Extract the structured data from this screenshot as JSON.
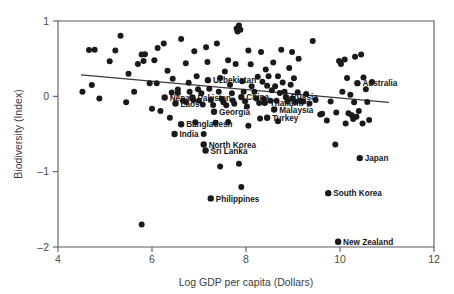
{
  "chart_data": {
    "type": "scatter",
    "title": "",
    "xlabel": "Log GDP per capita (Dollars)",
    "ylabel": "Biodiversity (Index)",
    "xlim": [
      4,
      12
    ],
    "ylim": [
      -2,
      1
    ],
    "xticks": [
      4,
      6,
      8,
      10,
      12
    ],
    "yticks": [
      1,
      0,
      -1,
      -2
    ],
    "xtick_labels": [
      "4",
      "6",
      "8",
      "10",
      "12"
    ],
    "ytick_labels": [
      "1",
      "0",
      "–1",
      "–2"
    ],
    "grid": false,
    "legend": null,
    "trendline": {
      "type": "linear",
      "x": [
        4.49,
        11.04
      ],
      "y": [
        0.285,
        -0.08
      ],
      "slope": -0.0557,
      "intercept": 0.535
    },
    "labeled_points": [
      {
        "label": "Uzbekistan",
        "x": 7.19,
        "y": 0.215,
        "anchor": "right"
      },
      {
        "label": "Nepal",
        "x": 6.27,
        "y": -0.015,
        "anchor": "right"
      },
      {
        "label": "Pakistan",
        "x": 6.86,
        "y": -0.015,
        "anchor": "right"
      },
      {
        "label": "China",
        "x": 7.9,
        "y": -0.01,
        "anchor": "right"
      },
      {
        "label": "Russia",
        "x": 8.85,
        "y": -0.01,
        "anchor": "right"
      },
      {
        "label": "Laos",
        "x": 6.5,
        "y": -0.095,
        "anchor": "right"
      },
      {
        "label": "Thailand",
        "x": 8.4,
        "y": -0.085,
        "anchor": "right"
      },
      {
        "label": "Malaysia",
        "x": 8.6,
        "y": -0.175,
        "anchor": "right"
      },
      {
        "label": "Georgia",
        "x": 7.32,
        "y": -0.205,
        "anchor": "right"
      },
      {
        "label": "Turkey",
        "x": 8.45,
        "y": -0.285,
        "anchor": "right"
      },
      {
        "label": "Bangladesh",
        "x": 6.62,
        "y": -0.37,
        "anchor": "right"
      },
      {
        "label": "India",
        "x": 6.48,
        "y": -0.5,
        "anchor": "right"
      },
      {
        "label": "North Korea",
        "x": 7.1,
        "y": -0.64,
        "anchor": "right"
      },
      {
        "label": "Sri Lanka",
        "x": 7.14,
        "y": -0.72,
        "anchor": "right"
      },
      {
        "label": "Philippines",
        "x": 7.25,
        "y": -1.355,
        "anchor": "right"
      },
      {
        "label": "Australia",
        "x": 10.37,
        "y": 0.175,
        "anchor": "right"
      },
      {
        "label": "Japan",
        "x": 10.42,
        "y": -0.82,
        "anchor": "right"
      },
      {
        "label": "South Korea",
        "x": 9.75,
        "y": -1.285,
        "anchor": "right"
      },
      {
        "label": "New Zealand",
        "x": 9.96,
        "y": -1.93,
        "anchor": "right"
      }
    ],
    "points": [
      {
        "x": 4.66,
        "y": 0.615
      },
      {
        "x": 4.78,
        "y": 0.62
      },
      {
        "x": 4.52,
        "y": 0.06
      },
      {
        "x": 4.72,
        "y": 0.15
      },
      {
        "x": 4.88,
        "y": -0.03
      },
      {
        "x": 5.22,
        "y": 0.61
      },
      {
        "x": 5.33,
        "y": 0.805
      },
      {
        "x": 5.1,
        "y": 0.465
      },
      {
        "x": 5.45,
        "y": -0.08
      },
      {
        "x": 5.62,
        "y": 0.06
      },
      {
        "x": 5.7,
        "y": 0.43
      },
      {
        "x": 5.78,
        "y": 0.555
      },
      {
        "x": 5.82,
        "y": 0.47
      },
      {
        "x": 5.85,
        "y": 0.56
      },
      {
        "x": 5.95,
        "y": 0.175
      },
      {
        "x": 6.1,
        "y": 0.175
      },
      {
        "x": 6.12,
        "y": 0.64
      },
      {
        "x": 6.25,
        "y": 0.7
      },
      {
        "x": 6.0,
        "y": -0.165
      },
      {
        "x": 6.18,
        "y": -0.195
      },
      {
        "x": 6.33,
        "y": 0.34
      },
      {
        "x": 6.42,
        "y": 0.05
      },
      {
        "x": 6.44,
        "y": 0.235
      },
      {
        "x": 6.55,
        "y": 0.09
      },
      {
        "x": 6.38,
        "y": -0.285
      },
      {
        "x": 6.62,
        "y": 0.76
      },
      {
        "x": 6.72,
        "y": 0.44
      },
      {
        "x": 6.78,
        "y": 0.18
      },
      {
        "x": 6.8,
        "y": 0.06
      },
      {
        "x": 6.66,
        "y": -0.06
      },
      {
        "x": 6.72,
        "y": -0.075
      },
      {
        "x": 6.9,
        "y": 0.6
      },
      {
        "x": 6.95,
        "y": 0.265
      },
      {
        "x": 6.98,
        "y": 0.095
      },
      {
        "x": 6.88,
        "y": -0.05
      },
      {
        "x": 7.0,
        "y": -0.06
      },
      {
        "x": 7.05,
        "y": 0.04
      },
      {
        "x": 7.08,
        "y": -0.11
      },
      {
        "x": 7.15,
        "y": 0.65
      },
      {
        "x": 7.18,
        "y": 0.455
      },
      {
        "x": 7.22,
        "y": 0.1
      },
      {
        "x": 7.25,
        "y": -0.05
      },
      {
        "x": 7.3,
        "y": -0.115
      },
      {
        "x": 7.1,
        "y": -0.5
      },
      {
        "x": 7.38,
        "y": 0.7
      },
      {
        "x": 7.45,
        "y": 0.245
      },
      {
        "x": 7.42,
        "y": 0.06
      },
      {
        "x": 7.48,
        "y": -0.035
      },
      {
        "x": 7.52,
        "y": -0.08
      },
      {
        "x": 7.55,
        "y": 0.33
      },
      {
        "x": 7.58,
        "y": -0.12
      },
      {
        "x": 7.35,
        "y": -0.35
      },
      {
        "x": 7.62,
        "y": 0.48
      },
      {
        "x": 7.66,
        "y": 0.155
      },
      {
        "x": 7.7,
        "y": 0.04
      },
      {
        "x": 7.72,
        "y": -0.055
      },
      {
        "x": 7.75,
        "y": -0.1
      },
      {
        "x": 7.8,
        "y": 0.9
      },
      {
        "x": 7.82,
        "y": 0.86
      },
      {
        "x": 7.85,
        "y": 0.94
      },
      {
        "x": 7.88,
        "y": 0.885
      },
      {
        "x": 7.78,
        "y": 0.43
      },
      {
        "x": 7.92,
        "y": 0.2
      },
      {
        "x": 7.95,
        "y": 0.06
      },
      {
        "x": 7.98,
        "y": -0.065
      },
      {
        "x": 8.02,
        "y": -0.135
      },
      {
        "x": 8.05,
        "y": 0.61
      },
      {
        "x": 8.1,
        "y": 0.425
      },
      {
        "x": 8.12,
        "y": 0.135
      },
      {
        "x": 8.18,
        "y": 0.06
      },
      {
        "x": 8.22,
        "y": -0.03
      },
      {
        "x": 8.25,
        "y": 0.26
      },
      {
        "x": 8.28,
        "y": -0.09
      },
      {
        "x": 8.32,
        "y": 0.59
      },
      {
        "x": 8.35,
        "y": 0.195
      },
      {
        "x": 8.38,
        "y": -0.035
      },
      {
        "x": 8.42,
        "y": 0.355
      },
      {
        "x": 8.45,
        "y": 0.14
      },
      {
        "x": 8.48,
        "y": 0.265
      },
      {
        "x": 8.52,
        "y": -0.06
      },
      {
        "x": 8.55,
        "y": 0.08
      },
      {
        "x": 8.58,
        "y": 0.45
      },
      {
        "x": 8.62,
        "y": 0.135
      },
      {
        "x": 8.65,
        "y": -0.06
      },
      {
        "x": 8.68,
        "y": 0.265
      },
      {
        "x": 8.72,
        "y": 0.045
      },
      {
        "x": 8.3,
        "y": -0.295
      },
      {
        "x": 8.75,
        "y": 0.62
      },
      {
        "x": 8.78,
        "y": 0.185
      },
      {
        "x": 8.82,
        "y": 0.06
      },
      {
        "x": 8.88,
        "y": -0.07
      },
      {
        "x": 8.92,
        "y": 0.375
      },
      {
        "x": 8.95,
        "y": 0.155
      },
      {
        "x": 8.98,
        "y": -0.03
      },
      {
        "x": 9.02,
        "y": 0.24
      },
      {
        "x": 9.05,
        "y": -0.075
      },
      {
        "x": 9.1,
        "y": 0.055
      },
      {
        "x": 9.15,
        "y": -0.06
      },
      {
        "x": 9.18,
        "y": -0.065
      },
      {
        "x": 9.22,
        "y": -0.07
      },
      {
        "x": 9.28,
        "y": 0.03
      },
      {
        "x": 9.35,
        "y": -0.095
      },
      {
        "x": 9.48,
        "y": -0.05
      },
      {
        "x": 9.58,
        "y": -0.24
      },
      {
        "x": 9.62,
        "y": -0.23
      },
      {
        "x": 9.72,
        "y": -0.32
      },
      {
        "x": 9.8,
        "y": -0.07
      },
      {
        "x": 9.92,
        "y": -0.215
      },
      {
        "x": 9.98,
        "y": 0.47
      },
      {
        "x": 10.02,
        "y": 0.43
      },
      {
        "x": 10.1,
        "y": 0.49
      },
      {
        "x": 10.05,
        "y": 0.06
      },
      {
        "x": 10.15,
        "y": 0.245
      },
      {
        "x": 10.22,
        "y": 0.02
      },
      {
        "x": 10.3,
        "y": -0.08
      },
      {
        "x": 10.18,
        "y": -0.225
      },
      {
        "x": 10.25,
        "y": -0.25
      },
      {
        "x": 10.28,
        "y": -0.3
      },
      {
        "x": 10.35,
        "y": -0.27
      },
      {
        "x": 10.4,
        "y": -0.195
      },
      {
        "x": 10.32,
        "y": 0.525
      },
      {
        "x": 10.45,
        "y": 0.555
      },
      {
        "x": 10.5,
        "y": 0.25
      },
      {
        "x": 10.55,
        "y": 0.095
      },
      {
        "x": 10.58,
        "y": -0.075
      },
      {
        "x": 10.62,
        "y": -0.315
      },
      {
        "x": 10.68,
        "y": 0.19
      },
      {
        "x": 10.12,
        "y": -0.36
      },
      {
        "x": 10.48,
        "y": -0.36
      },
      {
        "x": 5.78,
        "y": -1.7
      },
      {
        "x": 7.9,
        "y": -1.205
      },
      {
        "x": 7.85,
        "y": -0.895
      },
      {
        "x": 7.45,
        "y": -0.93
      },
      {
        "x": 9.9,
        "y": -0.64
      },
      {
        "x": 6.92,
        "y": -0.345
      },
      {
        "x": 7.62,
        "y": -0.34
      },
      {
        "x": 8.05,
        "y": -0.39
      },
      {
        "x": 8.68,
        "y": -0.33
      },
      {
        "x": 6.55,
        "y": 0.045
      },
      {
        "x": 5.5,
        "y": 0.3
      },
      {
        "x": 6.05,
        "y": 0.48
      },
      {
        "x": 9.42,
        "y": 0.735
      },
      {
        "x": 8.98,
        "y": 0.59
      },
      {
        "x": 9.12,
        "y": 0.5
      }
    ]
  },
  "figure": {
    "background_color": "#ffffff",
    "point_color": "#1a1a1a",
    "axis_color": "#5a5a5a",
    "trendline_color": "#3a3a3a"
  }
}
